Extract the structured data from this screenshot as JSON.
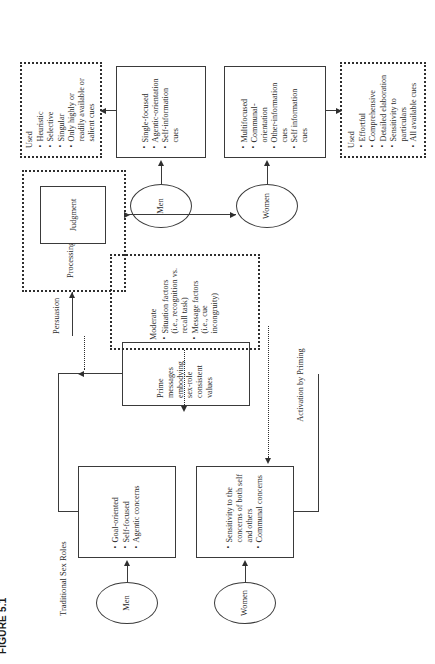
{
  "figure": {
    "caption": "FIGURE 5.1",
    "rotation_degrees": -90
  },
  "labels": {
    "traditional_sex_roles": "Traditional Sex Roles",
    "activation_by_priming": "Activation by\nPriming",
    "persuasion": "Persuasion",
    "processing": "Processing",
    "moderate": "Moderate"
  },
  "nodes": {
    "men_bottom": {
      "label": "Men"
    },
    "women_bottom": {
      "label": "Women"
    },
    "men_top": {
      "label": "Men"
    },
    "women_top": {
      "label": "Women"
    },
    "judgment": {
      "label": "Judgment"
    },
    "men_traits": {
      "bullets": [
        "Goal-oriented",
        "Self-focused",
        "Agentic concerns"
      ]
    },
    "women_traits": {
      "bullets": [
        "Sensitivity to the concerns of both self and others",
        "Communal concerns"
      ]
    },
    "prime_messages": {
      "text": "Prime messages embodying sex-role consistent values"
    },
    "moderators": {
      "title": "Moderate",
      "bullets": [
        "Situation factors (i.e., recognition vs. recall task)",
        "Message factors (i.e., cue incongruity)"
      ]
    },
    "men_processing_style": {
      "title": "Used",
      "bullets": [
        "Heuristic",
        "Selective",
        "Singular",
        "Only highly or readily available or salient cues"
      ]
    },
    "men_cues": {
      "bullets": [
        "Single-focused",
        "Agentic-orientation",
        "Self-information cues"
      ]
    },
    "women_cues": {
      "bullets": [
        "Multifocused",
        "Communal-orientation",
        "Other-information cues",
        "Self information cues"
      ]
    },
    "women_processing_style": {
      "title": "Used",
      "bullets": [
        "Effortful",
        "Comprehensive",
        "Detailed elaboration",
        "Sensitivity to particulars",
        "All available cues"
      ]
    }
  },
  "colors": {
    "line": "#3a3a3a",
    "text": "#2b2b2b",
    "background": "#ffffff"
  }
}
